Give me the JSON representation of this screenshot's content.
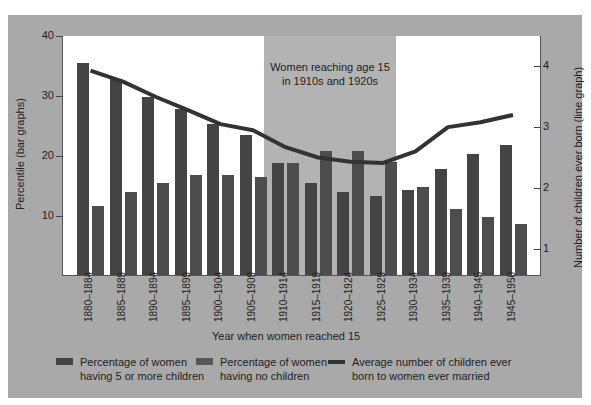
{
  "chart_data": {
    "type": "bar",
    "title": "",
    "xlabel": "Year when women reached 15",
    "ylabel": "Percentile (bar graphs)",
    "y2label": "Number of children ever born (line graph)",
    "ylim": [
      0,
      40
    ],
    "y2lim": [
      0.55,
      4.5
    ],
    "yticks": [
      10,
      20,
      30,
      40
    ],
    "y2ticks": [
      1,
      2,
      3,
      4
    ],
    "grid": false,
    "legend_position": "bottom",
    "categories": [
      "1880–1884",
      "1885–1889",
      "1890–1894",
      "1895–1899",
      "1900–1904",
      "1905–1909",
      "1910–1914",
      "1915–1919",
      "1920–1924",
      "1925–1929",
      "1930–1934",
      "1935–1939",
      "1940–1945",
      "1945–1950"
    ],
    "series": [
      {
        "name": "Percentage of women having 5 or more children",
        "type": "bar",
        "axis": "left",
        "color": "#444444",
        "values": [
          35.3,
          32.7,
          29.7,
          27.7,
          25.2,
          23.3,
          18.7,
          15.3,
          13.8,
          13.2,
          14.2,
          17.7,
          20.2,
          21.7
        ]
      },
      {
        "name": "Percentage of women having no children",
        "type": "bar",
        "axis": "left",
        "color": "#4d4d4d",
        "values": [
          11.5,
          13.8,
          15.3,
          16.7,
          16.7,
          16.3,
          18.7,
          20.7,
          20.7,
          18.8,
          14.7,
          11.0,
          9.7,
          8.5
        ]
      },
      {
        "name": "Average number of children ever born to women ever married",
        "type": "line",
        "axis": "right",
        "color": "#333333",
        "values": [
          3.93,
          3.75,
          3.5,
          3.28,
          3.05,
          2.95,
          2.67,
          2.5,
          2.43,
          2.41,
          2.6,
          3.0,
          3.08,
          3.2
        ]
      }
    ],
    "annotations": [
      {
        "text": "Women reaching age 15 in 1910s and 1920s",
        "span": [
          "1910–1914",
          "1925–1929"
        ]
      }
    ]
  },
  "annotation": {
    "line1": "Women reaching age 15",
    "line2": "in 1910s and 1920s"
  },
  "legend": {
    "item1": {
      "line1": "Percentage of women",
      "line2": "having 5 or more children"
    },
    "item2": {
      "line1": "Percentage of women",
      "line2": "having no children"
    },
    "item3": {
      "line1": "Average number of children ever",
      "line2": "born to women ever married"
    }
  },
  "colors": {
    "panel": "#a9a9a9",
    "band": "#b3b3b3",
    "bar_five_plus": "#444444",
    "bar_none": "#4d4d4d",
    "line": "#333333"
  }
}
